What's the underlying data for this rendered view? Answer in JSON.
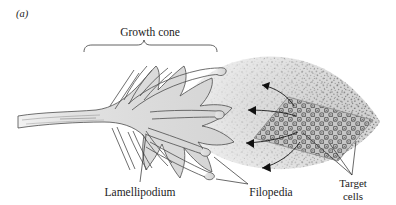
{
  "figure": {
    "panel_label": "(a)",
    "labels": {
      "growth_cone": "Growth cone",
      "lamellipodium": "Lamellipodium",
      "filopedia": "Filopedia",
      "target_cells_line1": "Target",
      "target_cells_line2": "cells"
    },
    "icons": {
      "bracket": "growth-cone-bracket",
      "gradient": "chemoattractant-gradient-stipple",
      "arrows": "diffusion-arrows",
      "target_patch": "target-cell-lattice"
    },
    "colors": {
      "cytoplasm_fill": "#d9d9d9",
      "cytoplasm_light": "#ebebeb",
      "outline": "#555555",
      "stipple": "#6b6b6b",
      "gradient_field": "#d6d6d6",
      "target_cells": "#9a9a9a",
      "text": "#1b1b1b",
      "background": "#ffffff"
    },
    "counts": {
      "arrows": 4,
      "filopodia": 12
    }
  }
}
